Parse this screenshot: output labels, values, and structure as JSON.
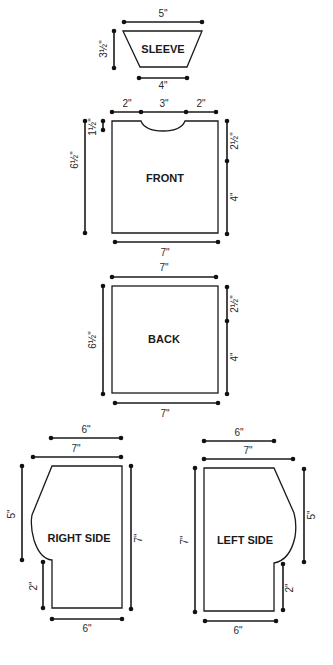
{
  "diagram": {
    "type": "sewing-pattern-schematic",
    "pieces": {
      "sleeve": {
        "label": "SLEEVE",
        "dims": {
          "top": "5\"",
          "height": "3½\"",
          "bottom": "4\""
        }
      },
      "front": {
        "label": "FRONT",
        "dims": {
          "top_left": "2\"",
          "top_neck": "3\"",
          "top_right": "2\"",
          "neck_depth": "1½\"",
          "height": "6½\"",
          "right_upper": "2½\"",
          "right_lower": "4\"",
          "bottom": "7\""
        }
      },
      "back": {
        "label": "BACK",
        "dims": {
          "top": "7\"",
          "height": "6½\"",
          "right_upper": "2½\"",
          "right_lower": "4\"",
          "bottom": "7\""
        }
      },
      "right_side": {
        "label": "RIGHT SIDE",
        "dims": {
          "top_short": "6\"",
          "top_long": "7\"",
          "curve_height": "5\"",
          "lower_step": "2\"",
          "height": "7\"",
          "bottom": "6\""
        }
      },
      "left_side": {
        "label": "LEFT SIDE",
        "dims": {
          "top_short": "6\"",
          "top_long": "7\"",
          "height": "7\"",
          "curve_height": "5\"",
          "lower_step": "2\"",
          "bottom": "6\""
        }
      }
    }
  }
}
